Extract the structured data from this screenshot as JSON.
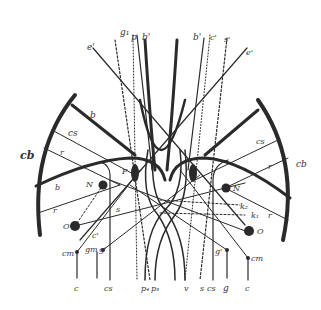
{
  "diagram": {
    "colors": {
      "ink": "#2a2a2a",
      "light_ink": "#555555",
      "background": "#ffffff"
    },
    "top_labels": {
      "g1": "g₁",
      "p": "p",
      "b_prime_left": "b'",
      "b_prime_right": "b'",
      "c_prime": "c'",
      "s_prime": "s'",
      "e_prime_left": "e'",
      "e_prime_right": "e'"
    },
    "left_labels": {
      "cb": "cb",
      "b_upper": "b",
      "cs": "cs",
      "r_upper": "r",
      "b_lower": "b",
      "r_lower": "r",
      "N": "N",
      "P": "P",
      "O": "O",
      "s": "s",
      "c_prime": "c'",
      "cm": "cm",
      "gm": "gm",
      "g_prime": "g'"
    },
    "right_labels": {
      "cb": "cb",
      "cs": "cs",
      "r_upper": "r",
      "r_lower": "r",
      "N": "N",
      "O": "O",
      "k2": "k₂",
      "k1": "k₁",
      "g_prime": "g'",
      "cm": "cm"
    },
    "bottom_labels": {
      "c_left": "c",
      "cs_left": "cs",
      "p4": "p₄",
      "p3": "p₃",
      "v": "v",
      "s": "s",
      "cs_right": "cs",
      "g": "g",
      "c_right": "c"
    }
  }
}
